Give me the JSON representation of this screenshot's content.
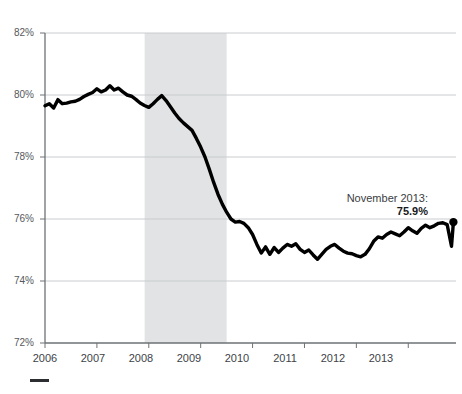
{
  "chart_data": {
    "type": "line",
    "title": "",
    "subtitle": "",
    "xlabel": "",
    "ylabel": "",
    "ylim": [
      72,
      82
    ],
    "xlim": [
      2006.0,
      2013.92
    ],
    "y_ticks": [
      72,
      74,
      76,
      78,
      80,
      82
    ],
    "y_tick_labels": [
      "72%",
      "74%",
      "76%",
      "78%",
      "80%",
      "82%"
    ],
    "x_ticks": [
      2006,
      2007,
      2008,
      2009,
      2010,
      2011,
      2012,
      2013
    ],
    "x_tick_labels": [
      "2006",
      "2007",
      "2008",
      "2009",
      "2010",
      "2011",
      "2012",
      "2013"
    ],
    "grid": true,
    "grid_axis": "y",
    "legend": "none",
    "line_color": "#000000",
    "line_width": 3.4,
    "grid_color": "#c9ccce",
    "axis_color": "#6e7276",
    "shaded_band": {
      "label": "recession",
      "x_start": 2007.92,
      "x_end": 2009.5,
      "color": "#e2e3e4"
    },
    "end_marker": {
      "x": 2013.87,
      "y": 75.9,
      "color": "#000000",
      "radius": 4.2
    },
    "annotation": {
      "line1": "November 2013:",
      "line2": "75.9%",
      "x": 2013.6,
      "y": 77.6
    },
    "x": [
      2006.0,
      2006.083,
      2006.167,
      2006.25,
      2006.333,
      2006.417,
      2006.5,
      2006.583,
      2006.667,
      2006.75,
      2006.833,
      2006.917,
      2007.0,
      2007.083,
      2007.167,
      2007.25,
      2007.333,
      2007.417,
      2007.5,
      2007.583,
      2007.667,
      2007.75,
      2007.833,
      2007.917,
      2008.0,
      2008.083,
      2008.167,
      2008.25,
      2008.333,
      2008.417,
      2008.5,
      2008.583,
      2008.667,
      2008.75,
      2008.833,
      2008.917,
      2009.0,
      2009.083,
      2009.167,
      2009.25,
      2009.333,
      2009.417,
      2009.5,
      2009.583,
      2009.667,
      2009.75,
      2009.833,
      2009.917,
      2010.0,
      2010.083,
      2010.167,
      2010.25,
      2010.333,
      2010.417,
      2010.5,
      2010.583,
      2010.667,
      2010.75,
      2010.833,
      2010.917,
      2011.0,
      2011.083,
      2011.167,
      2011.25,
      2011.333,
      2011.417,
      2011.5,
      2011.583,
      2011.667,
      2011.75,
      2011.833,
      2011.917,
      2012.0,
      2012.083,
      2012.167,
      2012.25,
      2012.333,
      2012.417,
      2012.5,
      2012.583,
      2012.667,
      2012.75,
      2012.833,
      2012.917,
      2013.0,
      2013.083,
      2013.167,
      2013.25,
      2013.333,
      2013.417,
      2013.5,
      2013.583,
      2013.667,
      2013.75,
      2013.833,
      2013.87
    ],
    "y": [
      79.65,
      79.72,
      79.58,
      79.85,
      79.72,
      79.74,
      79.78,
      79.8,
      79.86,
      79.95,
      80.02,
      80.08,
      80.2,
      80.1,
      80.16,
      80.3,
      80.16,
      80.22,
      80.1,
      80.0,
      79.96,
      79.86,
      79.74,
      79.66,
      79.6,
      79.72,
      79.86,
      79.98,
      79.82,
      79.62,
      79.42,
      79.24,
      79.1,
      78.98,
      78.86,
      78.6,
      78.32,
      78.0,
      77.6,
      77.18,
      76.8,
      76.48,
      76.22,
      76.0,
      75.9,
      75.92,
      75.86,
      75.72,
      75.5,
      75.18,
      74.9,
      75.1,
      74.86,
      75.08,
      74.92,
      75.06,
      75.18,
      75.12,
      75.2,
      75.02,
      74.92,
      75.0,
      74.84,
      74.7,
      74.86,
      75.02,
      75.12,
      75.18,
      75.06,
      74.96,
      74.9,
      74.88,
      74.82,
      74.78,
      74.86,
      75.04,
      75.28,
      75.42,
      75.38,
      75.5,
      75.58,
      75.52,
      75.46,
      75.58,
      75.72,
      75.62,
      75.54,
      75.7,
      75.8,
      75.72,
      75.78,
      75.86,
      75.88,
      75.82,
      75.12,
      75.9
    ]
  },
  "axes": {
    "y_labels": [
      "82%",
      "80%",
      "78%",
      "76%",
      "74%",
      "72%"
    ],
    "x_labels": [
      "2006",
      "2007",
      "2008",
      "2009",
      "2010",
      "2011",
      "2012",
      "2013"
    ]
  },
  "annotation": {
    "line1": "November 2013:",
    "line2": "75.9%"
  }
}
